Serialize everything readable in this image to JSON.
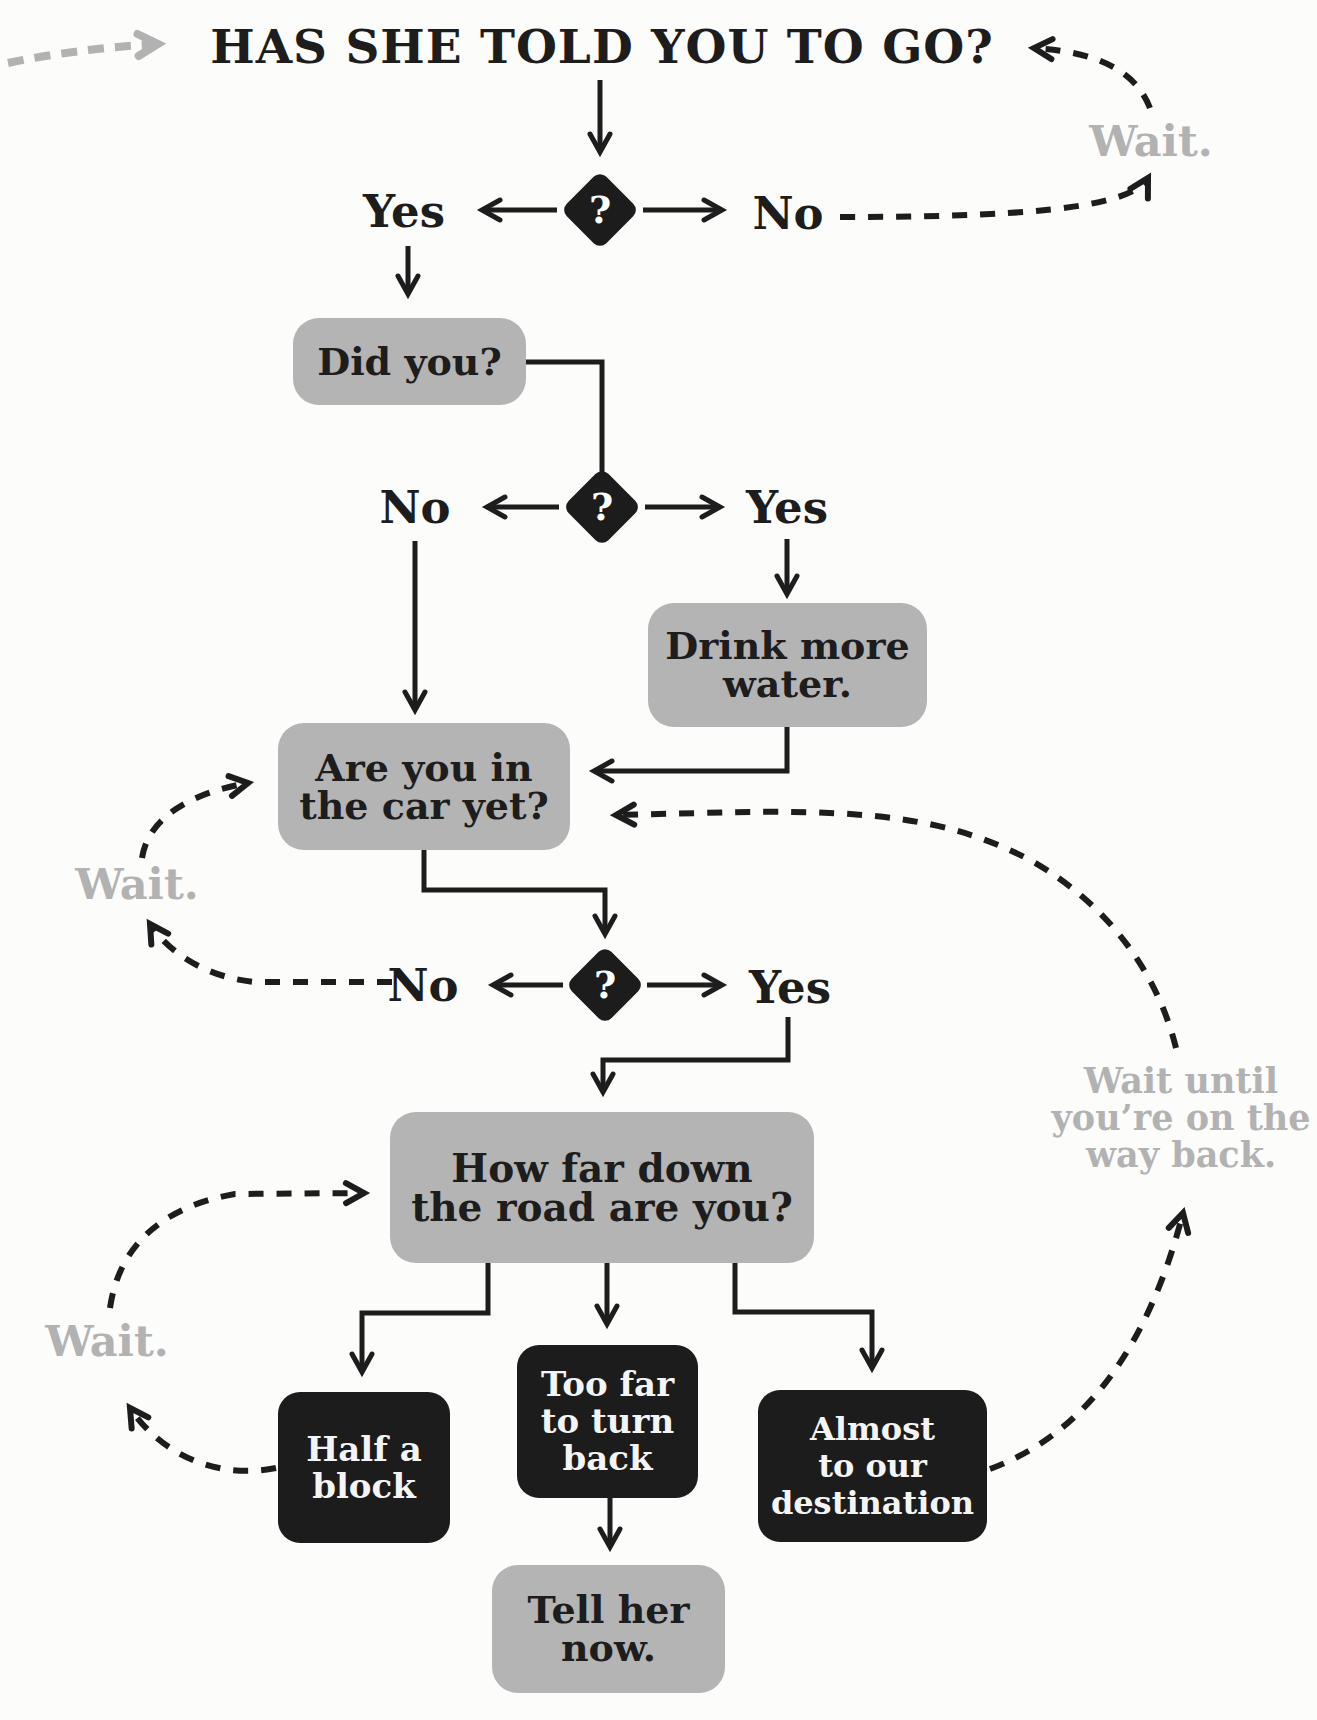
{
  "title": "HAS SHE TOLD YOU TO GO?",
  "decisions": [
    {
      "symbol": "?",
      "left_label": "Yes",
      "right_label": "No"
    },
    {
      "symbol": "?",
      "left_label": "No",
      "right_label": "Yes"
    },
    {
      "symbol": "?",
      "left_label": "No",
      "right_label": "Yes"
    }
  ],
  "boxes": {
    "did_you": {
      "lines": [
        "Did you?"
      ]
    },
    "drink_water": {
      "lines": [
        "Drink more",
        "water."
      ]
    },
    "in_car": {
      "lines": [
        "Are you in",
        "the car yet?"
      ]
    },
    "how_far": {
      "lines": [
        "How far down",
        "the road are you?"
      ]
    },
    "half_block": {
      "lines": [
        "Half a",
        "block"
      ]
    },
    "too_far": {
      "lines": [
        "Too far",
        "to turn",
        "back"
      ]
    },
    "almost": {
      "lines": [
        "Almost",
        "to our",
        "destination"
      ]
    },
    "tell_her": {
      "lines": [
        "Tell her",
        "now."
      ]
    }
  },
  "wait_labels": {
    "top_right": "Wait.",
    "mid_left": "Wait.",
    "bottom_left": "Wait.",
    "right_loop": [
      "Wait until",
      "you’re on the",
      "way back."
    ]
  },
  "colors": {
    "background": "#fcfcfb",
    "ink": "#1d1d1d",
    "box_gray": "#b4b4b4",
    "box_black": "#1c1c1c",
    "wait_gray": "#b2b2b2",
    "text_on_black": "#f4f4f4"
  }
}
